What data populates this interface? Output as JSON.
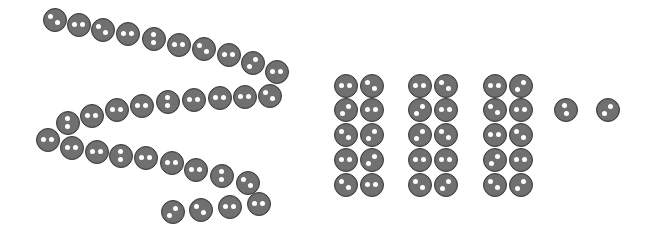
{
  "scene": {
    "description": "Buttons arranged as a winding chain, three groups of ten, and two single buttons",
    "colors": {
      "button_fill": "#707070",
      "button_border": "#3c3c3c",
      "hole": "#ffffff",
      "background": "#ffffff"
    },
    "chain": {
      "count": 32,
      "buttons": [
        {
          "x": 55,
          "y": 20,
          "holes": "diag"
        },
        {
          "x": 79,
          "y": 25,
          "holes": "h"
        },
        {
          "x": 103,
          "y": 30,
          "holes": "diag"
        },
        {
          "x": 128,
          "y": 34,
          "holes": "h"
        },
        {
          "x": 154,
          "y": 39,
          "holes": "v"
        },
        {
          "x": 179,
          "y": 45,
          "holes": "h"
        },
        {
          "x": 204,
          "y": 49,
          "holes": "diag"
        },
        {
          "x": 229,
          "y": 55,
          "holes": "h"
        },
        {
          "x": 253,
          "y": 63,
          "holes": "diag2"
        },
        {
          "x": 277,
          "y": 72,
          "holes": "h"
        },
        {
          "x": 270,
          "y": 96,
          "holes": "diag"
        },
        {
          "x": 245,
          "y": 97,
          "holes": "h"
        },
        {
          "x": 220,
          "y": 98,
          "holes": "h"
        },
        {
          "x": 194,
          "y": 100,
          "holes": "h"
        },
        {
          "x": 168,
          "y": 102,
          "holes": "v"
        },
        {
          "x": 142,
          "y": 106,
          "holes": "h"
        },
        {
          "x": 117,
          "y": 110,
          "holes": "h"
        },
        {
          "x": 92,
          "y": 116,
          "holes": "h"
        },
        {
          "x": 68,
          "y": 123,
          "holes": "v"
        },
        {
          "x": 48,
          "y": 140,
          "holes": "h"
        },
        {
          "x": 72,
          "y": 148,
          "holes": "h"
        },
        {
          "x": 97,
          "y": 152,
          "holes": "h"
        },
        {
          "x": 121,
          "y": 156,
          "holes": "v"
        },
        {
          "x": 146,
          "y": 158,
          "holes": "h"
        },
        {
          "x": 172,
          "y": 163,
          "holes": "h"
        },
        {
          "x": 196,
          "y": 170,
          "holes": "h"
        },
        {
          "x": 222,
          "y": 176,
          "holes": "v"
        },
        {
          "x": 248,
          "y": 183,
          "holes": "diag"
        },
        {
          "x": 173,
          "y": 212,
          "holes": "diag2"
        },
        {
          "x": 201,
          "y": 210,
          "holes": "diag"
        },
        {
          "x": 230,
          "y": 207,
          "holes": "h"
        },
        {
          "x": 259,
          "y": 204,
          "holes": "h"
        }
      ]
    },
    "groups_of_ten": [
      {
        "count": 10,
        "columns": [
          346,
          372
        ],
        "rows": [
          86,
          110,
          135,
          160,
          185
        ]
      },
      {
        "count": 10,
        "columns": [
          420,
          446
        ],
        "rows": [
          86,
          110,
          135,
          160,
          185
        ]
      },
      {
        "count": 10,
        "columns": [
          495,
          521
        ],
        "rows": [
          86,
          110,
          135,
          160,
          185
        ]
      }
    ],
    "singles": [
      {
        "x": 566,
        "y": 110,
        "holes": "v2"
      },
      {
        "x": 608,
        "y": 110,
        "holes": "diag2"
      }
    ],
    "totals": {
      "chain": 32,
      "tens": 30,
      "ones": 2
    }
  }
}
